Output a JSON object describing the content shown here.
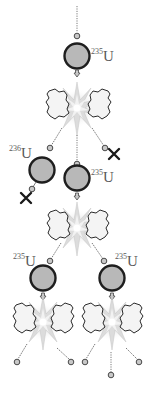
{
  "colors": {
    "nucleus_fill": "#b8b8b8",
    "nucleus_stroke": "#1e1e1e",
    "neutron_fill": "#c8c8c8",
    "neutron_stroke": "#4a4a4a",
    "line": "#7a7a7a",
    "fragment_fill": "#f4f4f4",
    "fragment_stroke": "#2a2a2a",
    "flash": "#d8d8d8",
    "absorbed_x": "#1a1a1a",
    "label": "#5a5a5a"
  },
  "nuclei": [
    {
      "id": "n1",
      "isotope_mass": "235",
      "element": "U",
      "generation": 1
    },
    {
      "id": "n2",
      "isotope_mass": "236",
      "element": "U",
      "generation": 2,
      "note": "neutron capture, no fission"
    },
    {
      "id": "n3",
      "isotope_mass": "235",
      "element": "U",
      "generation": 2
    },
    {
      "id": "n4",
      "isotope_mass": "235",
      "element": "U",
      "generation": 3
    },
    {
      "id": "n5",
      "isotope_mass": "235",
      "element": "U",
      "generation": 3
    }
  ],
  "markers": {
    "absorbed_neutron_symbol": "X"
  }
}
